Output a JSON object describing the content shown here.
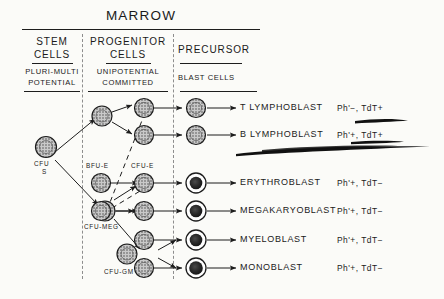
{
  "title": "MARROW",
  "columns": [
    {
      "name": "stem",
      "heading_line1": "STEM",
      "heading_line2": "CELLS",
      "sub_line1": "PLURI-MULTI",
      "sub_line2": "POTENTIAL"
    },
    {
      "name": "progenitor",
      "heading_line1": "PROGENITOR",
      "heading_line2": "CELLS",
      "sub_line1": "UNIPOTENTIAL",
      "sub_line2": "COMMITTED"
    },
    {
      "name": "precursor",
      "heading_line1": "PRECURSOR",
      "heading_line2": "",
      "sub_line1": "BLAST CELLS",
      "sub_line2": ""
    }
  ],
  "cell_labels": [
    {
      "id": "cfu-s",
      "line1": "CFU",
      "line2": "S"
    },
    {
      "id": "bfu-e",
      "line1": "BFU-E",
      "line2": ""
    },
    {
      "id": "cfu-e",
      "line1": "CFU-E",
      "line2": ""
    },
    {
      "id": "cfu-meg",
      "line1": "CFU-MEG",
      "line2": ""
    },
    {
      "id": "cfu-gm",
      "line1": "CFU-GM",
      "line2": ""
    }
  ],
  "rows": [
    {
      "name": "T LYMPHOBLAST",
      "ph": "Ph",
      "ph_mark": "'−",
      "tdt": "TdT+",
      "markers": "Ph'−, TdT+"
    },
    {
      "name": "B LYMPHOBLAST",
      "ph": "Ph",
      "ph_mark": "'+",
      "tdt": "TdT+",
      "markers": "Ph'+, TdT+"
    },
    {
      "name": "ERYTHROBLAST",
      "ph": "Ph",
      "ph_mark": "'+",
      "tdt": "TdT−",
      "markers": "Ph'+, TdT−"
    },
    {
      "name": "MEGAKARYOBLAST",
      "ph": "Ph",
      "ph_mark": "'+",
      "tdt": "TdT−",
      "markers": "Ph'+, TdT−"
    },
    {
      "name": "MYELOBLAST",
      "ph": "Ph",
      "ph_mark": "'+",
      "tdt": "TdT−",
      "markers": "Ph'+, TdT−"
    },
    {
      "name": "MONOBLAST",
      "ph": "Ph",
      "ph_mark": "'+",
      "tdt": "TdT−",
      "markers": "Ph'+, TdT−"
    }
  ],
  "annotations": [
    {
      "id": "underline-row1",
      "target": "TdT+ of T LYMPHOBLAST"
    },
    {
      "id": "underline-row2",
      "target": "TdT+ of B LYMPHOBLAST"
    },
    {
      "id": "sweep-stroke",
      "target": "below B LYMPHOBLAST row"
    }
  ],
  "colors": {
    "ink": "#1d1d1d",
    "divider": "#8d8d8d",
    "paper": "#fbfbf8",
    "nucleus": "#2a2a2a"
  }
}
